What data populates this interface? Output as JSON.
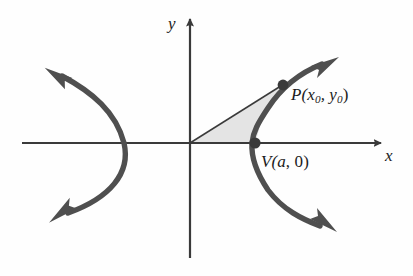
{
  "figure": {
    "type": "math-diagram",
    "background_color": "#fefefe",
    "axes": {
      "color": "#3a3a3a",
      "x_label": "x",
      "y_label": "y",
      "origin": [
        190,
        143
      ],
      "x_axis_from": [
        22,
        143
      ],
      "x_axis_to": [
        383,
        143
      ],
      "y_axis_from": [
        190,
        258
      ],
      "y_axis_to": [
        190,
        16
      ]
    },
    "curve": {
      "color": "#4f4f4f",
      "stroke_width": 5,
      "description": "hyperbola, two branches opening left and right, arrowheads on all four ends",
      "left_vertex": [
        124,
        143
      ],
      "right_vertex": [
        252,
        143
      ]
    },
    "shaded_region": {
      "fill_color": "#e4e4e4",
      "edge_color": "#3a3a3a",
      "description": "region bounded by segment from origin to P, the hyperbola arc from P to V, and the x-axis from V to origin"
    },
    "points": [
      {
        "name": "P",
        "label_prefix": "P(x",
        "label_sub1": "0",
        "label_mid": ", y",
        "label_sub2": "0",
        "label_suffix": ")",
        "label_text": "P(x0, y0)",
        "position": [
          283,
          85
        ],
        "dot_color": "#3a3a3a"
      },
      {
        "name": "V",
        "label_prefix": "V(",
        "label_var": "a",
        "label_suffix": ", 0)",
        "label_text": "V(a, 0)",
        "position": [
          255,
          143
        ],
        "dot_color": "#3a3a3a"
      }
    ]
  }
}
